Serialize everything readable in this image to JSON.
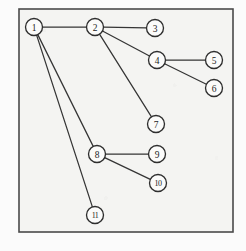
{
  "figure": {
    "kind": "undirected-node-link-graph",
    "background_color": "#f4f4f2",
    "page_color": "#fbfbfb",
    "frame": {
      "x": 19,
      "y": 9,
      "width": 214,
      "height": 223,
      "stroke_color": "#4a4a4a"
    },
    "node_style": {
      "radius": 8.5,
      "fill": "#fbfbfa",
      "stroke_color": "#2e2e2e"
    },
    "edge_style": {
      "stroke_color": "#353535"
    }
  },
  "graph_data": {
    "type": "node-link-diagram",
    "directed": false,
    "node_count": 11,
    "edge_count": 10,
    "nodes": [
      {
        "id": "1",
        "label": "1",
        "x": 34,
        "y": 27
      },
      {
        "id": "2",
        "label": "2",
        "x": 95,
        "y": 27
      },
      {
        "id": "3",
        "label": "3",
        "x": 155,
        "y": 28
      },
      {
        "id": "4",
        "label": "4",
        "x": 157,
        "y": 60
      },
      {
        "id": "5",
        "label": "5",
        "x": 214,
        "y": 60
      },
      {
        "id": "6",
        "label": "6",
        "x": 214,
        "y": 88
      },
      {
        "id": "7",
        "label": "7",
        "x": 156,
        "y": 124
      },
      {
        "id": "8",
        "label": "8",
        "x": 97,
        "y": 154
      },
      {
        "id": "9",
        "label": "9",
        "x": 157,
        "y": 154
      },
      {
        "id": "10",
        "label": "10",
        "x": 158,
        "y": 183
      },
      {
        "id": "11",
        "label": "11",
        "x": 95,
        "y": 215
      }
    ],
    "edges": [
      {
        "source": "1",
        "target": "2"
      },
      {
        "source": "1",
        "target": "8"
      },
      {
        "source": "1",
        "target": "11"
      },
      {
        "source": "2",
        "target": "3"
      },
      {
        "source": "2",
        "target": "4"
      },
      {
        "source": "2",
        "target": "7"
      },
      {
        "source": "4",
        "target": "5"
      },
      {
        "source": "4",
        "target": "6"
      },
      {
        "source": "8",
        "target": "9"
      },
      {
        "source": "8",
        "target": "10"
      }
    ]
  }
}
